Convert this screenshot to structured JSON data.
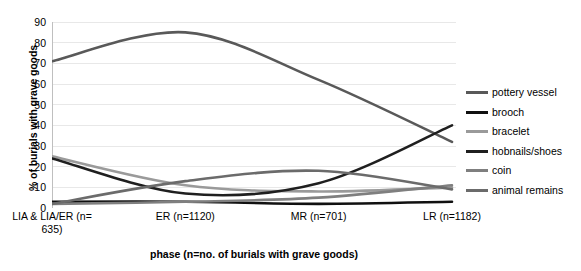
{
  "chart_data": {
    "type": "line",
    "title": "",
    "xlabel": "phase (n=no. of burials with grave goods)",
    "ylabel": "% of burials with grave goods",
    "categories": [
      "LIA & LIA/ER (n=635)",
      "ER (n=1120)",
      "MR (n=701)",
      "LR (n=1182)"
    ],
    "ylim": [
      0,
      90
    ],
    "yticks": [
      0,
      10,
      20,
      30,
      40,
      50,
      60,
      70,
      80,
      90
    ],
    "grid": "horizontal",
    "legend_position": "right",
    "smoothing": "spline",
    "series": [
      {
        "name": "pottery vessel",
        "values": [
          71,
          85,
          62,
          32
        ],
        "color": "#595959"
      },
      {
        "name": "brooch",
        "values": [
          3,
          3,
          2,
          3
        ],
        "color": "#101010"
      },
      {
        "name": "bracelet",
        "values": [
          25,
          11,
          8,
          10
        ],
        "color": "#9a9a9a"
      },
      {
        "name": "hobnails/shoes",
        "values": [
          24,
          7,
          12,
          40
        ],
        "color": "#1f1f1f"
      },
      {
        "name": "coin",
        "values": [
          2,
          3,
          5,
          11
        ],
        "color": "#7f7f7f"
      },
      {
        "name": "animal remains",
        "values": [
          2,
          13,
          18,
          9
        ],
        "color": "#6b6b6b"
      }
    ]
  },
  "axes": {
    "y_title": "% of burials with grave goods",
    "x_title": "phase (n=no. of burials with grave goods)",
    "y_tick_labels": [
      "90",
      "80",
      "70",
      "60",
      "50",
      "40",
      "30",
      "20",
      "10",
      "0"
    ],
    "x_tick_labels": [
      "LIA & LIA/ER (n=\n635)",
      "ER (n=1120)",
      "MR (n=701)",
      "LR (n=1182)"
    ],
    "x_tick_lines": [
      {
        "line1": "LIA & LIA/ER (n=",
        "line2": "635)"
      },
      {
        "line1": "ER (n=1120)",
        "line2": ""
      },
      {
        "line1": "MR (n=701)",
        "line2": ""
      },
      {
        "line1": "LR (n=1182)",
        "line2": ""
      }
    ]
  },
  "legend": {
    "items": [
      {
        "label": "pottery vessel",
        "color": "#595959"
      },
      {
        "label": "brooch",
        "color": "#101010"
      },
      {
        "label": "bracelet",
        "color": "#9a9a9a"
      },
      {
        "label": "hobnails/shoes",
        "color": "#1f1f1f"
      },
      {
        "label": "coin",
        "color": "#7f7f7f"
      },
      {
        "label": "animal remains",
        "color": "#6b6b6b"
      }
    ]
  },
  "style": {
    "grid_color": "#e8e8e8",
    "axis_color": "#bfbfbf",
    "background": "#ffffff"
  }
}
